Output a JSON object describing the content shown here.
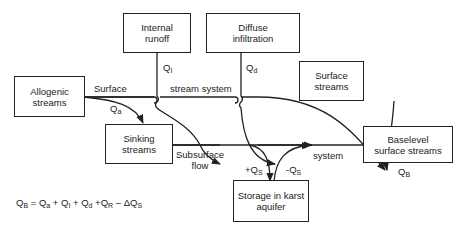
{
  "boxes": {
    "internal_runoff": "Internal runoff",
    "diffuse_infiltration": "Diffuse infiltration",
    "allogenic_streams": "Allogenic streams",
    "surface_streams": "Surface streams",
    "sinking_streams": "Sinking streams",
    "baselevel_surface_streams": "Baselevel surface streams",
    "storage_karst_aquifer": "Storage in karst aquifer"
  },
  "labels": {
    "surface": "Surface",
    "stream_system": "stream system",
    "subsurface_flow": "Subsurface flow",
    "system": "system",
    "q_i": {
      "base": "Q",
      "sub": "I"
    },
    "q_d": {
      "base": "Q",
      "sub": "d"
    },
    "q_a": {
      "base": "Q",
      "sub": "a"
    },
    "q_b": {
      "base": "Q",
      "sub": "B"
    },
    "plus_q_s": {
      "base": "+Q",
      "sub": "S"
    },
    "minus_q_s": {
      "base": "-Q",
      "sub": "S"
    }
  },
  "equation": {
    "lhs": "Q",
    "lhs_sub": "B",
    "t1": "Q",
    "t1_sub": "a",
    "t2": "Q",
    "t2_sub": "I",
    "t3": "Q",
    "t3_sub": "d",
    "t4": "Q",
    "t4_sub": "R",
    "t5": "ΔQ",
    "t5_sub": "S"
  }
}
